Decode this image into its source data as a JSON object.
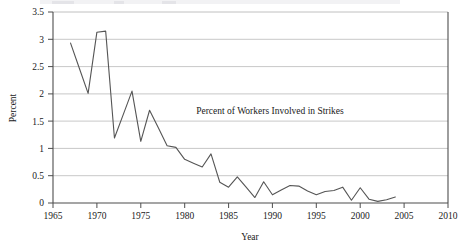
{
  "chart_data": {
    "type": "line",
    "title": "",
    "annotation": "Percent of Workers Involved in Strikes",
    "xlabel": "Year",
    "ylabel": "Percent",
    "xlim": [
      1965,
      2010
    ],
    "ylim": [
      0,
      3.5
    ],
    "xticks": [
      1965,
      1970,
      1975,
      1980,
      1985,
      1990,
      1995,
      2000,
      2005,
      2010
    ],
    "xtick_labels": [
      "1965",
      "1970",
      "1975",
      "1980",
      "1985",
      "1990",
      "1995",
      "2000",
      "2005",
      "2010"
    ],
    "yticks": [
      0,
      0.5,
      1,
      1.5,
      2,
      2.5,
      3,
      3.5
    ],
    "ytick_labels": [
      "0",
      "0.5",
      "1",
      "1.5",
      "2",
      "2.5",
      "3",
      "3.5"
    ],
    "grid": "horizontal",
    "legend": "none",
    "line_color": "#555555",
    "grid_color": "#c8c8c8",
    "axis_color": "#4d4d4d",
    "series": [
      {
        "name": "Percent of Workers Involved in Strikes",
        "x": [
          1967,
          1968,
          1969,
          1970,
          1971,
          1972,
          1973,
          1974,
          1975,
          1976,
          1977,
          1978,
          1979,
          1980,
          1981,
          1982,
          1983,
          1984,
          1985,
          1986,
          1987,
          1988,
          1989,
          1990,
          1991,
          1992,
          1993,
          1994,
          1995,
          1996,
          1997,
          1998,
          1999,
          2000,
          2001,
          2002,
          2003,
          2004
        ],
        "values": [
          2.93,
          2.47,
          2.01,
          3.13,
          3.15,
          1.19,
          1.62,
          2.05,
          1.13,
          1.7,
          1.38,
          1.05,
          1.02,
          0.8,
          0.73,
          0.66,
          0.9,
          0.38,
          0.29,
          0.48,
          0.29,
          0.1,
          0.39,
          0.15,
          0.24,
          0.32,
          0.31,
          0.22,
          0.15,
          0.21,
          0.23,
          0.29,
          0.05,
          0.28,
          0.07,
          0.03,
          0.06,
          0.11
        ]
      }
    ]
  },
  "top_cropped_caption": ""
}
